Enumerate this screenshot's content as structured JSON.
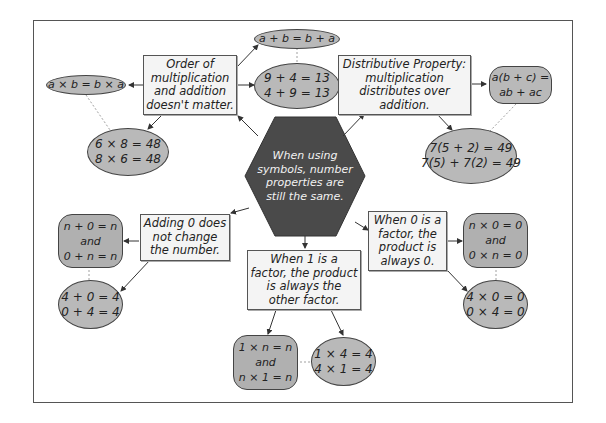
{
  "diagram": {
    "center": {
      "lines": [
        "When using",
        "symbols, number",
        "properties are",
        "still the same."
      ],
      "fill": "#4a4a4a"
    },
    "nodes": {
      "commutative": {
        "lines": [
          "Order of",
          "multiplication",
          "and addition",
          "doesn't matter."
        ],
        "symbolic_add": "a + b = b + a",
        "symbolic_mult": "a × b = b × a",
        "example_add": [
          "9 + 4 = 13",
          "4 + 9 = 13"
        ],
        "example_mult": [
          "6 × 8 = 48",
          "8 × 6 = 48"
        ]
      },
      "distributive": {
        "lines": [
          "Distributive Property:",
          "multiplication",
          "distributes over",
          "addition."
        ],
        "symbolic": [
          "a(b + c) =",
          "ab + ac"
        ],
        "example": [
          "7(5 + 2) = 49",
          "7(5) + 7(2) = 49"
        ]
      },
      "additive_identity": {
        "lines": [
          "Adding 0 does",
          "not change",
          "the number."
        ],
        "symbolic": [
          "n + 0 = n",
          "and",
          "0 + n = n"
        ],
        "example": [
          "4 + 0 = 4",
          "0 + 4 = 4"
        ]
      },
      "multiplicative_identity": {
        "lines": [
          "When 1 is a",
          "factor, the product",
          "is always the",
          "other factor."
        ],
        "symbolic": [
          "1 × n = n",
          "and",
          "n × 1 = n"
        ],
        "example": [
          "1 × 4 = 4",
          "4 × 1 = 4"
        ]
      },
      "zero_property": {
        "lines": [
          "When 0 is a",
          "factor, the",
          "product is",
          "always 0."
        ],
        "symbolic": [
          "n × 0 = 0",
          "and",
          "0 × n = 0"
        ],
        "example": [
          "4 × 0 = 0",
          "0 × 4 = 0"
        ]
      }
    },
    "colors": {
      "box_fill": "#f4f4f4",
      "oval_fill": "#b9b9b9",
      "rounded_fill": "#b0b0b0",
      "hexagon_fill": "#4a4a4a",
      "line": "#333333"
    }
  }
}
